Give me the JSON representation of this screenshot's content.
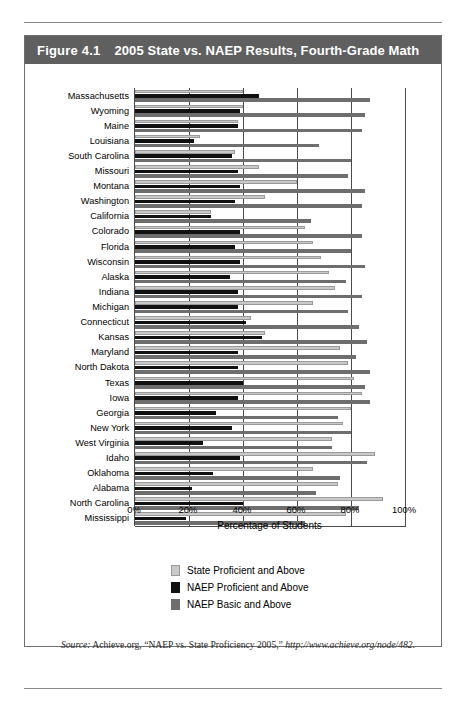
{
  "figure": {
    "number": "Figure 4.1",
    "title": "2005 State vs. NAEP Results, Fourth-Grade Math",
    "title_bar_color": "#5f5f5f"
  },
  "source_note": {
    "label": "Source:",
    "text": "Achieve.org, “NAEP vs. State Proficiency 2005,”",
    "url": "http://www.achieve.org/node/482."
  },
  "legend": {
    "items": [
      {
        "label": "State Proficient and Above",
        "color": "#c9c9c9",
        "key": "state"
      },
      {
        "label": "NAEP Proficient and Above",
        "color": "#111111",
        "key": "naep_proficient"
      },
      {
        "label": "NAEP Basic and Above",
        "color": "#6e6e6e",
        "key": "naep_basic"
      }
    ]
  },
  "chart_data": {
    "type": "bar",
    "orientation": "horizontal",
    "title": "2005 State vs. NAEP Results, Fourth-Grade Math",
    "xlabel": "Percentage of Students",
    "ylabel": "",
    "xlim": [
      0,
      100
    ],
    "xticks": [
      0,
      20,
      40,
      60,
      80,
      100
    ],
    "xtick_labels": [
      "0%",
      "20%",
      "40%",
      "60%",
      "80%",
      "100%"
    ],
    "grid": true,
    "legend_position": "bottom-center",
    "categories": [
      "Massachusetts",
      "Wyoming",
      "Maine",
      "Louisiana",
      "South Carolina",
      "Missouri",
      "Montana",
      "Washington",
      "California",
      "Colorado",
      "Florida",
      "Wisconsin",
      "Alaska",
      "Indiana",
      "Michigan",
      "Connecticut",
      "Kansas",
      "Maryland",
      "North Dakota",
      "Texas",
      "Iowa",
      "Georgia",
      "New York",
      "West Virginia",
      "Idaho",
      "Oklahoma",
      "Alabama",
      "North Carolina",
      "Mississippi"
    ],
    "series": [
      {
        "name": "State Proficient and Above",
        "color": "#c9c9c9",
        "values": [
          40,
          40,
          38,
          24,
          37,
          46,
          60,
          48,
          28,
          63,
          66,
          69,
          72,
          74,
          66,
          43,
          48,
          76,
          79,
          81,
          84,
          80,
          77,
          73,
          89,
          66,
          75,
          92,
          78
        ]
      },
      {
        "name": "NAEP Proficient and Above",
        "color": "#111111",
        "values": [
          46,
          39,
          38,
          22,
          36,
          38,
          39,
          37,
          28,
          39,
          37,
          39,
          35,
          38,
          38,
          41,
          47,
          38,
          38,
          40,
          38,
          30,
          36,
          25,
          39,
          29,
          21,
          40,
          19
        ]
      },
      {
        "name": "NAEP Basic and Above",
        "color": "#6e6e6e",
        "values": [
          87,
          85,
          84,
          68,
          80,
          79,
          85,
          84,
          65,
          84,
          80,
          85,
          78,
          84,
          79,
          83,
          86,
          82,
          87,
          85,
          87,
          75,
          80,
          73,
          86,
          76,
          67,
          83,
          63
        ]
      }
    ]
  }
}
